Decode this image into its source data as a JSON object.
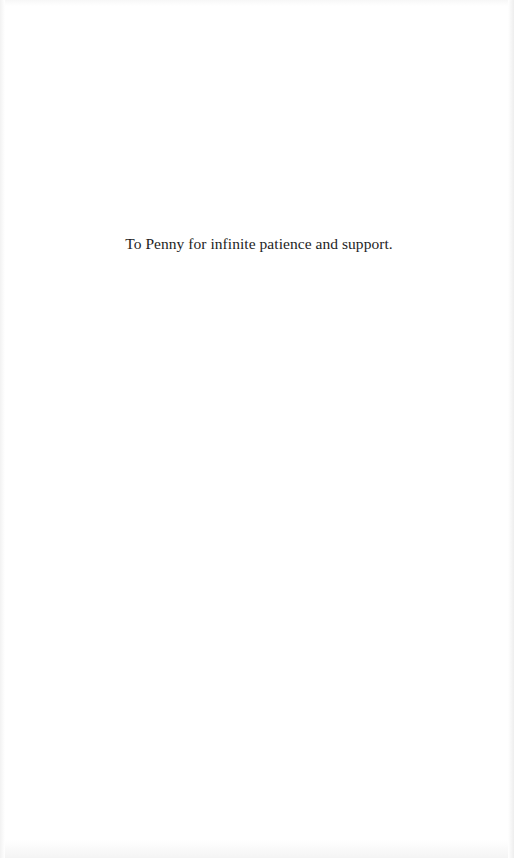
{
  "document": {
    "dedication": "To Penny for infinite patience and support."
  }
}
